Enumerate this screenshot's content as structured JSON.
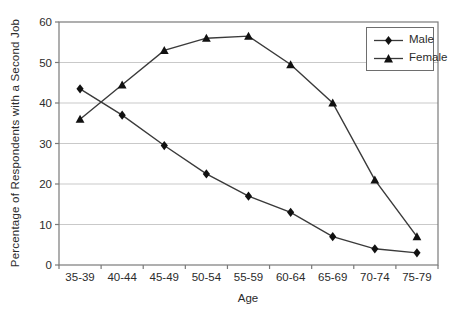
{
  "chart_data": {
    "type": "line",
    "title": "",
    "xlabel": "Age",
    "ylabel": "Percentage of Respondents with a Second Job",
    "categories": [
      "35-39",
      "40-44",
      "45-49",
      "50-54",
      "55-59",
      "60-64",
      "65-69",
      "70-74",
      "75-79"
    ],
    "series": [
      {
        "name": "Male",
        "marker": "diamond",
        "values": [
          43.5,
          37,
          29.5,
          22.5,
          17,
          13,
          7,
          4,
          3
        ]
      },
      {
        "name": "Female",
        "marker": "triangle",
        "values": [
          36,
          44.5,
          53,
          56,
          56.5,
          49.5,
          40,
          21,
          7
        ]
      }
    ],
    "ylim": [
      0,
      60
    ],
    "yticks": [
      0,
      10,
      20,
      30,
      40,
      50,
      60
    ],
    "grid": "horizontal-light",
    "legend_position": "top-right-inside"
  },
  "colors": {
    "series_line": "#3a3a3a",
    "marker_fill": "#111111",
    "gridline": "#c9c9c9",
    "frame": "#7a7a7a",
    "text": "#2b2b2b",
    "background": "#ffffff"
  }
}
